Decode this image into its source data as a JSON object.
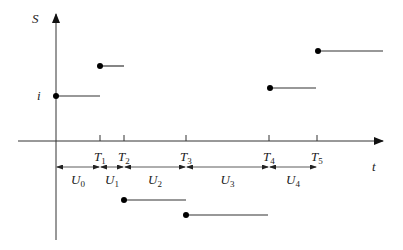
{
  "chart_data": {
    "type": "step",
    "title": "",
    "xlabel": "t",
    "ylabel": "S",
    "y_tick_labels": [
      {
        "label": "i",
        "level": "i"
      }
    ],
    "time_marks": [
      "T1",
      "T2",
      "T3",
      "T4",
      "T5"
    ],
    "intervals": [
      {
        "label": "U0",
        "from": "0",
        "to": "T1"
      },
      {
        "label": "U1",
        "from": "T1",
        "to": "T2"
      },
      {
        "label": "U2",
        "from": "T2",
        "to": "T3"
      },
      {
        "label": "U3",
        "from": "T3",
        "to": "T4"
      },
      {
        "label": "U4",
        "from": "T4",
        "to": "T5"
      }
    ],
    "segments": [
      {
        "start": "0",
        "end": "T1",
        "level_px": 96,
        "description": "value i, positive"
      },
      {
        "start": "T1",
        "end": "T2",
        "level_px": 66,
        "description": "jump up"
      },
      {
        "start": "T2",
        "end": "T3",
        "level_px": 200,
        "description": "negative"
      },
      {
        "start": "T3",
        "end": "T4",
        "level_px": 215,
        "description": "more negative"
      },
      {
        "start": "T4",
        "end": "T5",
        "level_px": 88,
        "description": "positive"
      },
      {
        "start": "T5",
        "end": "open",
        "level_px": 51,
        "description": "highest, continues"
      }
    ],
    "grid": false,
    "legend": null
  },
  "render": {
    "origin_x": 56,
    "axis_y": 141,
    "yaxis_top": 14,
    "yaxis_bottom": 240,
    "xaxis_left": 18,
    "xaxis_right": 383,
    "ticks_x": [
      100,
      124,
      186,
      269,
      317
    ],
    "arrow_row_y": 167,
    "steps": [
      {
        "x1": 56,
        "x2": 100,
        "y": 96
      },
      {
        "x1": 100,
        "x2": 124,
        "y": 66
      },
      {
        "x1": 124,
        "x2": 186,
        "y": 200
      },
      {
        "x1": 186,
        "x2": 268,
        "y": 215
      },
      {
        "x1": 270,
        "x2": 316,
        "y": 88
      },
      {
        "x1": 318,
        "x2": 383,
        "y": 51
      }
    ],
    "line_color": "#333333"
  },
  "labels": {
    "y_axis": "S",
    "x_axis": "t",
    "i_label": "i",
    "T": [
      {
        "main": "T",
        "sub": "1"
      },
      {
        "main": "T",
        "sub": "2"
      },
      {
        "main": "T",
        "sub": "3"
      },
      {
        "main": "T",
        "sub": "4"
      },
      {
        "main": "T",
        "sub": "5"
      }
    ],
    "U": [
      {
        "main": "U",
        "sub": "0"
      },
      {
        "main": "U",
        "sub": "1"
      },
      {
        "main": "U",
        "sub": "2"
      },
      {
        "main": "U",
        "sub": "3"
      },
      {
        "main": "U",
        "sub": "4"
      }
    ]
  }
}
